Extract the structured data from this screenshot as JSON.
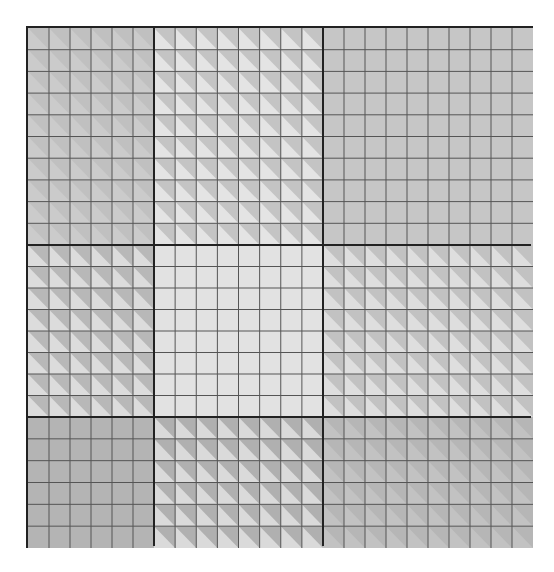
{
  "diagram": {
    "title": "",
    "frame": {
      "left": 26,
      "top": 26,
      "width": 507,
      "height": 522,
      "border_color": "#222222"
    },
    "column_boundaries": [
      0,
      126,
      295,
      505
    ],
    "row_boundaries": [
      0,
      217,
      389,
      520
    ],
    "grid_line_color": "#555555",
    "blocks": [
      {
        "id": "r0c0",
        "row": 0,
        "col": 0,
        "cols": 6,
        "rows": 10,
        "pattern": "diagonal",
        "dark": "#c0c0c0",
        "light": "#cbcbcb"
      },
      {
        "id": "r0c1",
        "row": 0,
        "col": 1,
        "cols": 8,
        "rows": 10,
        "pattern": "diagonal",
        "dark": "#c4c4c4",
        "light": "#e4e4e4"
      },
      {
        "id": "r0c2",
        "row": 0,
        "col": 2,
        "cols": 10,
        "rows": 10,
        "pattern": "flat",
        "dark": "#c6c6c6",
        "light": "#c6c6c6"
      },
      {
        "id": "r1c0",
        "row": 1,
        "col": 0,
        "cols": 6,
        "rows": 8,
        "pattern": "diagonal",
        "dark": "#b8b8b8",
        "light": "#dcdcdc"
      },
      {
        "id": "r1c1",
        "row": 1,
        "col": 1,
        "cols": 8,
        "rows": 8,
        "pattern": "flat",
        "dark": "#e2e2e2",
        "light": "#e2e2e2"
      },
      {
        "id": "r1c2",
        "row": 1,
        "col": 2,
        "cols": 10,
        "rows": 8,
        "pattern": "diagonal",
        "dark": "#c2c2c2",
        "light": "#dedede"
      },
      {
        "id": "r2c0",
        "row": 2,
        "col": 0,
        "cols": 6,
        "rows": 6,
        "pattern": "flat",
        "dark": "#b4b4b4",
        "light": "#b4b4b4"
      },
      {
        "id": "r2c1",
        "row": 2,
        "col": 1,
        "cols": 8,
        "rows": 6,
        "pattern": "diagonal",
        "dark": "#b0b0b0",
        "light": "#dadada"
      },
      {
        "id": "r2c2",
        "row": 2,
        "col": 2,
        "cols": 10,
        "rows": 6,
        "pattern": "diagonal",
        "dark": "#b6b6b6",
        "light": "#c2c2c2"
      }
    ]
  }
}
